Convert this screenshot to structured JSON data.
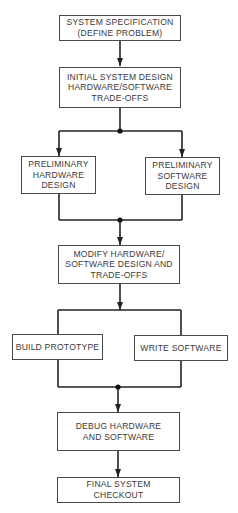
{
  "diagram": {
    "type": "flowchart",
    "colors": {
      "line": "#222222",
      "box_border": "#4a4a4a",
      "text": "#3a3a3a",
      "background": "#ffffff"
    },
    "nodes": {
      "system_spec": {
        "lines": [
          "SYSTEM SPECIFICATION",
          "(DEFINE PROBLEM)"
        ]
      },
      "initial_design": {
        "lines": [
          "INITIAL SYSTEM DESIGN",
          "HARDWARE/SOFTWARE",
          "TRADE-OFFS"
        ]
      },
      "prelim_hardware": {
        "lines": [
          "PRELIMINARY",
          "HARDWARE",
          "DESIGN"
        ]
      },
      "prelim_software": {
        "lines": [
          "PRELIMINARY",
          "SOFTWARE",
          "DESIGN"
        ]
      },
      "modify_design": {
        "lines": [
          "MODIFY HARDWARE/",
          "SOFTWARE DESIGN AND",
          "TRADE-OFFS"
        ]
      },
      "build_prototype": {
        "lines": [
          "BUILD PROTOTYPE"
        ]
      },
      "write_software": {
        "lines": [
          "WRITE SOFTWARE"
        ]
      },
      "debug": {
        "lines": [
          "DEBUG HARDWARE",
          "AND SOFTWARE"
        ]
      },
      "final_checkout": {
        "lines": [
          "FINAL SYSTEM",
          "CHECKOUT"
        ]
      }
    },
    "edges": [
      {
        "from": "system_spec",
        "to": "initial_design"
      },
      {
        "from": "initial_design",
        "to": [
          "prelim_hardware",
          "prelim_software"
        ],
        "junction": "split-dot"
      },
      {
        "from": [
          "prelim_hardware",
          "prelim_software"
        ],
        "to": "modify_design",
        "junction": "merge-dot"
      },
      {
        "from": "modify_design",
        "to": [
          "build_prototype",
          "write_software"
        ],
        "junction": "split"
      },
      {
        "from": [
          "build_prototype",
          "write_software"
        ],
        "to": "debug",
        "junction": "merge-dot"
      },
      {
        "from": "debug",
        "to": "final_checkout"
      }
    ]
  }
}
